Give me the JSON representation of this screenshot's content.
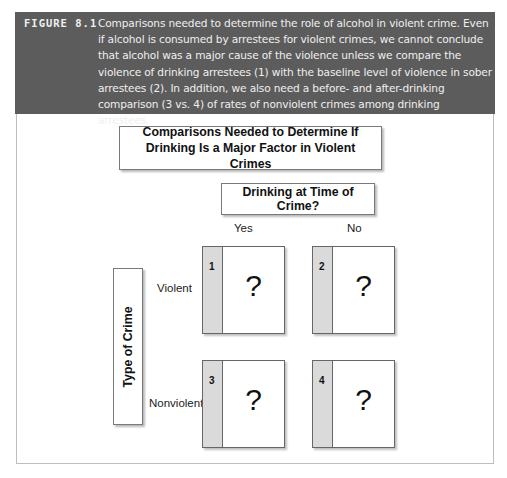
{
  "figure": {
    "label": "FIGURE 8.1",
    "caption": "Comparisons needed to determine the role of alcohol in violent crime. Even if alcohol is consumed by arrestees for violent crimes, we cannot conclude that alcohol was a major cause of the violence unless we compare the violence of drinking arrestees (1) with the baseline level of violence in sober arrestees (2). In addition, we also need a before- and after-drinking comparison (3 vs. 4) of rates of nonviolent crimes among drinking arrestees."
  },
  "diagram": {
    "title": "Comparisons Needed to Determine If Drinking Is a Major Factor in Violent Crimes",
    "column_header": "Drinking at Time of Crime?",
    "columns": [
      "Yes",
      "No"
    ],
    "row_header": "Type of Crime",
    "rows": [
      "Violent",
      "Nonviolent"
    ],
    "cells": [
      {
        "number": "1",
        "value": "?"
      },
      {
        "number": "2",
        "value": "?"
      },
      {
        "number": "3",
        "value": "?"
      },
      {
        "number": "4",
        "value": "?"
      }
    ]
  }
}
